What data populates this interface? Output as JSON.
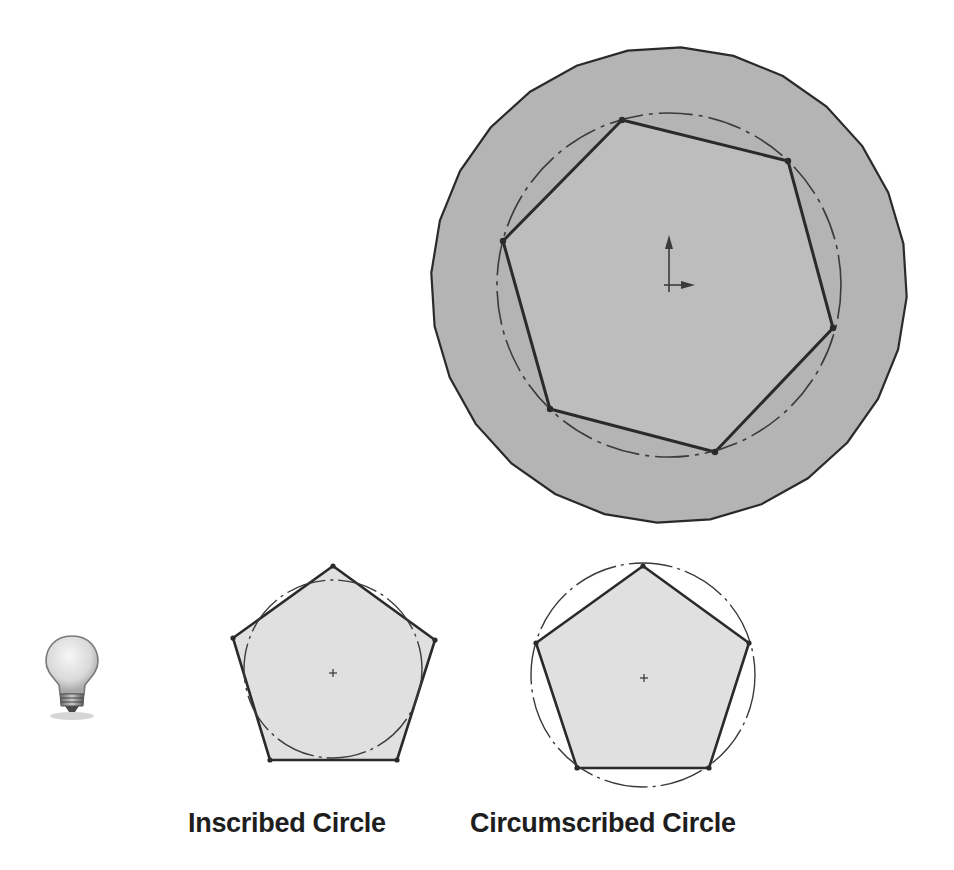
{
  "figure": {
    "type": "polygon-sketch-illustration",
    "colors": {
      "outline": "#2b2b2b",
      "outer_fill": "#b4b4b4",
      "inner_fill": "#bdbdbd",
      "small_fill": "#e0e0e0",
      "construction_line": "#3a3a3a"
    },
    "main_sketch": {
      "description": "Heptagon inscribed in a dash-dot construction circle, inside a faceted outer circle",
      "outer_circle": {
        "cx": 669,
        "cy": 285,
        "r": 238,
        "facets": 28
      },
      "construction_circle": {
        "cx": 669,
        "cy": 285,
        "r": 172,
        "style": "dash-dot"
      },
      "heptagon_vertices": [
        [
          622,
          120
        ],
        [
          788,
          161
        ],
        [
          833,
          328
        ],
        [
          715,
          452
        ],
        [
          550,
          409
        ],
        [
          503,
          241
        ],
        [
          622,
          120
        ]
      ],
      "origin_icon": "origin-axes-icon"
    },
    "examples": [
      {
        "label": "Inscribed Circle",
        "polygon": "pentagon",
        "vertices": [
          [
            333,
            566
          ],
          [
            435,
            640
          ],
          [
            397,
            760
          ],
          [
            270,
            760
          ],
          [
            233,
            638
          ]
        ],
        "circle": {
          "cx": 333,
          "cy": 670,
          "r": 90,
          "style": "dash-dot"
        },
        "center": [
          333,
          673
        ]
      },
      {
        "label": "Circumscribed Circle",
        "polygon": "pentagon",
        "vertices": [
          [
            643,
            566
          ],
          [
            749,
            643
          ],
          [
            709,
            768
          ],
          [
            577,
            768
          ],
          [
            536,
            643
          ]
        ],
        "circle": {
          "cx": 644,
          "cy": 676,
          "r": 111,
          "style": "dash-dot"
        },
        "center": [
          644,
          678
        ]
      }
    ],
    "tip_icon": "lightbulb-icon"
  },
  "labels": {
    "inscribed": "Inscribed Circle",
    "circumscribed": "Circumscribed Circle"
  }
}
